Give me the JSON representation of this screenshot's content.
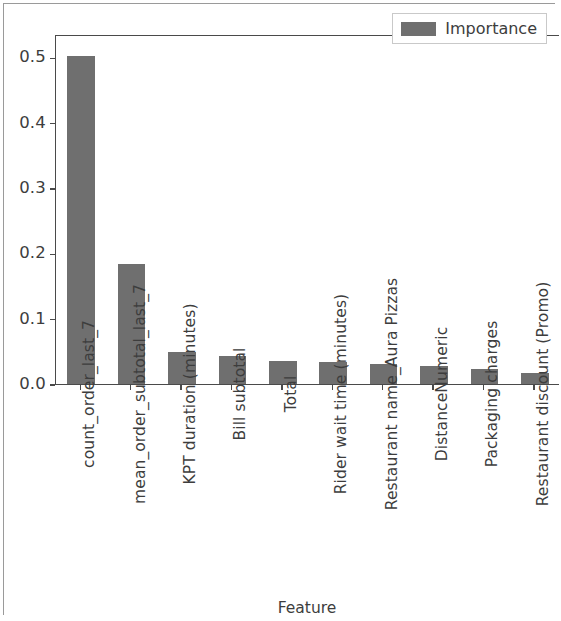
{
  "chart_data": {
    "type": "bar",
    "title": "",
    "xlabel": "Feature",
    "ylabel": "",
    "categories": [
      "count_order_last_7",
      "mean_order_subtotal_last_7",
      "KPT duration (minutes)",
      "Bill subtotal",
      "Total",
      "Rider wait time (minutes)",
      "Restaurant name_Aura Pizzas",
      "DistanceNumeric",
      "Packaging charges",
      "Restaurant discount (Promo)"
    ],
    "values": [
      0.502,
      0.184,
      0.049,
      0.043,
      0.035,
      0.034,
      0.031,
      0.027,
      0.023,
      0.017
    ],
    "series": [
      {
        "name": "Importance",
        "values": [
          0.502,
          0.184,
          0.049,
          0.043,
          0.035,
          0.034,
          0.031,
          0.027,
          0.023,
          0.017
        ]
      }
    ],
    "ylim": [
      0.0,
      0.5357
    ],
    "yticks": [
      0.0,
      0.1,
      0.2,
      0.3,
      0.4,
      0.5
    ],
    "ytick_labels": [
      "0.0",
      "0.1",
      "0.2",
      "0.3",
      "0.4",
      "0.5"
    ],
    "grid": false,
    "legend": {
      "position": "upper right",
      "entries": [
        "Importance"
      ]
    },
    "bar_color": "#6f6f6f",
    "axis_color": "#4a4a4a",
    "background_color": "#ffffff"
  }
}
